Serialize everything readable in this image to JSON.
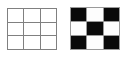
{
  "figure": {
    "background_color": "#ffffff",
    "panels": [
      {
        "name": "empty-grid",
        "label": "empty 3x3 grid",
        "rows": 3,
        "columns": 3,
        "line_color": "#808080",
        "cell_fill": "#ffffff",
        "cells": [
          [
            "white",
            "white",
            "white"
          ],
          [
            "white",
            "white",
            "white"
          ],
          [
            "white",
            "white",
            "white"
          ]
        ]
      },
      {
        "name": "checker-grid",
        "label": "3x3 checkerboard",
        "rows": 3,
        "columns": 3,
        "line_color": "#9a9a9a",
        "black_color": "#0a0a0a",
        "white_color": "#fdfdfd",
        "cells": [
          [
            "black",
            "white",
            "black"
          ],
          [
            "white",
            "black",
            "white"
          ],
          [
            "black",
            "white",
            "black"
          ]
        ]
      }
    ]
  },
  "chart_data": {
    "type": "heatmap",
    "title": "",
    "xlabel": "",
    "ylabel": "",
    "grid": true,
    "legend": "none",
    "panels": [
      {
        "name": "empty-grid",
        "rows": 3,
        "columns": 3,
        "values": [
          [
            0,
            0,
            0
          ],
          [
            0,
            0,
            0
          ],
          [
            0,
            0,
            0
          ]
        ],
        "colormap": {
          "0": "#ffffff",
          "1": "#000000"
        }
      },
      {
        "name": "checker-grid",
        "rows": 3,
        "columns": 3,
        "values": [
          [
            1,
            0,
            1
          ],
          [
            0,
            1,
            0
          ],
          [
            1,
            0,
            1
          ]
        ],
        "colormap": {
          "0": "#ffffff",
          "1": "#000000"
        }
      }
    ]
  }
}
